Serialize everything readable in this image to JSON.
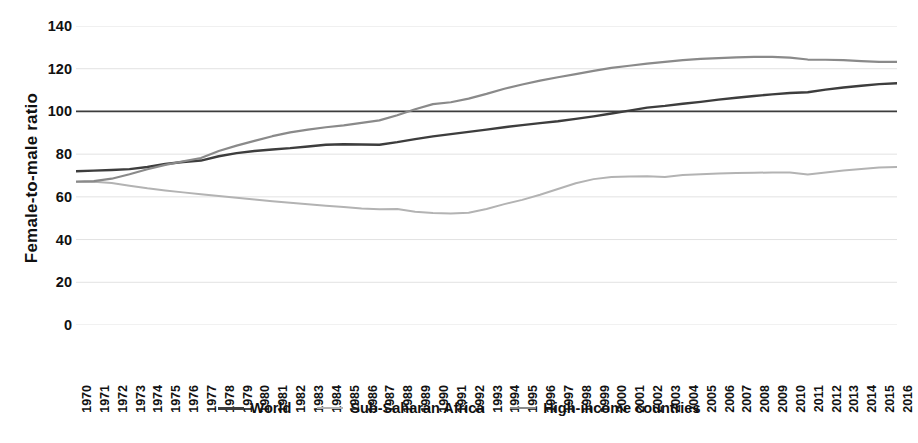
{
  "chart_data": {
    "type": "line",
    "title": "",
    "xlabel": "",
    "ylabel": "Female-to-male ratio",
    "ylim": [
      0,
      140
    ],
    "ytick_step": 20,
    "yticks": [
      140,
      120,
      100,
      80,
      60,
      40,
      20,
      0
    ],
    "grid": true,
    "grid_axis": "y",
    "legend_position": "bottom-center",
    "x": [
      1970,
      1971,
      1972,
      1973,
      1974,
      1975,
      1976,
      1977,
      1978,
      1979,
      1980,
      1981,
      1982,
      1983,
      1984,
      1985,
      1986,
      1987,
      1988,
      1989,
      1990,
      1991,
      1992,
      1993,
      1994,
      1995,
      1996,
      1997,
      1998,
      1999,
      2000,
      2001,
      2002,
      2003,
      2004,
      2005,
      2006,
      2007,
      2008,
      2009,
      2010,
      2011,
      2012,
      2013,
      2014,
      2015,
      2016
    ],
    "xtick_labels": [
      "1970",
      "1971",
      "1972",
      "1973",
      "1974",
      "1975",
      "1976",
      "1977",
      "1978",
      "1979",
      "1980",
      "1981",
      "1982",
      "1983",
      "1984",
      "1985",
      "1986",
      "1987",
      "1988",
      "1989",
      "1990",
      "1991",
      "1992",
      "1993",
      "1994",
      "1995",
      "1996",
      "1997",
      "1998",
      "1999",
      "2000",
      "2001",
      "2002",
      "2003",
      "2004",
      "2005",
      "2006",
      "2007",
      "2008",
      "2009",
      "2010",
      "2011",
      "2012",
      "2013",
      "2014",
      "2015",
      "2016"
    ],
    "series": [
      {
        "name": "World",
        "color": "#3d3d3d",
        "width": 2.4,
        "values": [
          72.0,
          72.3,
          72.6,
          73.0,
          74.0,
          75.4,
          76.3,
          77.0,
          79.0,
          80.5,
          81.5,
          82.2,
          82.8,
          83.6,
          84.4,
          84.6,
          84.5,
          84.4,
          85.6,
          87.0,
          88.3,
          89.4,
          90.4,
          91.5,
          92.6,
          93.6,
          94.5,
          95.4,
          96.5,
          97.7,
          99.0,
          100.4,
          101.8,
          102.6,
          103.6,
          104.5,
          105.5,
          106.4,
          107.2,
          108.0,
          108.6,
          109.0,
          110.2,
          111.2,
          112.0,
          112.8,
          113.2
        ]
      },
      {
        "name": "Sub-Saharan Africa",
        "color": "#b3b3b3",
        "width": 2.0,
        "values": [
          67.0,
          67.1,
          66.5,
          65.2,
          64.0,
          63.0,
          62.1,
          61.2,
          60.4,
          59.6,
          58.8,
          58.0,
          57.2,
          56.5,
          55.8,
          55.2,
          54.6,
          54.2,
          54.3,
          53.0,
          52.4,
          52.2,
          52.6,
          54.3,
          56.6,
          58.6,
          61.0,
          63.7,
          66.4,
          68.3,
          69.3,
          69.5,
          69.7,
          69.3,
          70.2,
          70.6,
          70.9,
          71.2,
          71.3,
          71.4,
          71.4,
          70.5,
          71.4,
          72.3,
          73.0,
          73.7,
          74.0
        ]
      },
      {
        "name": "High-income countries",
        "color": "#8a8a8a",
        "width": 2.2,
        "values": [
          67.2,
          67.4,
          68.5,
          70.6,
          72.9,
          75.0,
          76.6,
          78.2,
          81.5,
          84.0,
          86.2,
          88.4,
          90.2,
          91.5,
          92.6,
          93.5,
          94.6,
          95.8,
          98.2,
          101.0,
          103.4,
          104.3,
          106.0,
          108.2,
          110.6,
          112.6,
          114.4,
          116.0,
          117.5,
          119.0,
          120.4,
          121.4,
          122.4,
          123.2,
          124.0,
          124.6,
          125.0,
          125.3,
          125.5,
          125.5,
          125.2,
          124.3,
          124.2,
          124.0,
          123.6,
          123.2,
          123.2
        ]
      }
    ],
    "reference_line": {
      "name": "parity-line",
      "value": 100,
      "color": "#3d3d3d",
      "width": 1.8
    }
  },
  "legend": {
    "items": [
      {
        "label": "World",
        "color": "#3d3d3d",
        "width": 3
      },
      {
        "label": "Sub-Saharan Africa",
        "color": "#b3b3b3",
        "width": 2
      },
      {
        "label": "High-income countries",
        "color": "#8a8a8a",
        "width": 2
      }
    ]
  },
  "axis": {
    "y_title": "Female-to-male ratio"
  },
  "colors": {
    "background": "#ffffff",
    "grid": "#e2e2e2",
    "text": "#111111"
  }
}
